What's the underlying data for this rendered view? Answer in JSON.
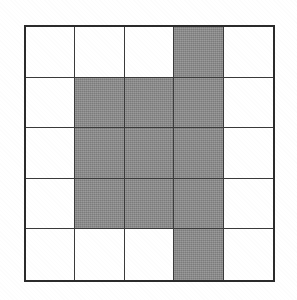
{
  "figure": {
    "kind": "shaded-grid",
    "grid": {
      "rows": 5,
      "columns": 5,
      "row_labels": [
        "1",
        "2",
        "3",
        "4",
        "5"
      ],
      "column_labels": [
        "1",
        "2",
        "3",
        "4",
        "5"
      ],
      "shaded_count": 11,
      "unshaded_count": 14
    },
    "colors": {
      "shaded": "#8a8a8a",
      "unshaded": "#ffffff",
      "grid_line": "#3a3a3a",
      "outer_border": "#2b2b2b",
      "page_background": "#ffffff"
    },
    "cells": [
      [
        {
          "row": 1,
          "col": 1,
          "state": "unshaded"
        },
        {
          "row": 1,
          "col": 2,
          "state": "unshaded"
        },
        {
          "row": 1,
          "col": 3,
          "state": "unshaded"
        },
        {
          "row": 1,
          "col": 4,
          "state": "shaded"
        },
        {
          "row": 1,
          "col": 5,
          "state": "unshaded"
        }
      ],
      [
        {
          "row": 2,
          "col": 1,
          "state": "unshaded"
        },
        {
          "row": 2,
          "col": 2,
          "state": "shaded"
        },
        {
          "row": 2,
          "col": 3,
          "state": "shaded"
        },
        {
          "row": 2,
          "col": 4,
          "state": "shaded"
        },
        {
          "row": 2,
          "col": 5,
          "state": "unshaded"
        }
      ],
      [
        {
          "row": 3,
          "col": 1,
          "state": "unshaded"
        },
        {
          "row": 3,
          "col": 2,
          "state": "shaded"
        },
        {
          "row": 3,
          "col": 3,
          "state": "shaded"
        },
        {
          "row": 3,
          "col": 4,
          "state": "shaded"
        },
        {
          "row": 3,
          "col": 5,
          "state": "unshaded"
        }
      ],
      [
        {
          "row": 4,
          "col": 1,
          "state": "unshaded"
        },
        {
          "row": 4,
          "col": 2,
          "state": "shaded"
        },
        {
          "row": 4,
          "col": 3,
          "state": "shaded"
        },
        {
          "row": 4,
          "col": 4,
          "state": "shaded"
        },
        {
          "row": 4,
          "col": 5,
          "state": "unshaded"
        }
      ],
      [
        {
          "row": 5,
          "col": 1,
          "state": "unshaded"
        },
        {
          "row": 5,
          "col": 2,
          "state": "unshaded"
        },
        {
          "row": 5,
          "col": 3,
          "state": "unshaded"
        },
        {
          "row": 5,
          "col": 4,
          "state": "shaded"
        },
        {
          "row": 5,
          "col": 5,
          "state": "unshaded"
        }
      ]
    ]
  }
}
